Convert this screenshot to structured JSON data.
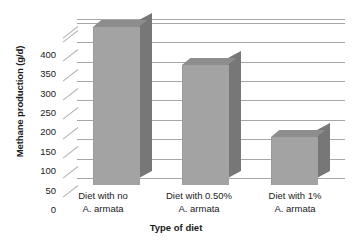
{
  "clipped_title": "Figure: Methane production by diet",
  "chart_data": {
    "type": "bar",
    "title": "",
    "subtitle": "",
    "xlabel": "Type of diet",
    "ylabel": "Methane production (g/d)",
    "categories": [
      "Diet with no\nA. armata",
      "Diet with 0.50%\nA. armata",
      "Diet with 1%\nA. armata"
    ],
    "category_lines": [
      [
        "Diet with no",
        "A. armata"
      ],
      [
        "Diet with 0.50%",
        "A. armata"
      ],
      [
        "Diet with 1%",
        "A. armata"
      ]
    ],
    "values": [
      408,
      308,
      123
    ],
    "ylim": [
      0,
      400
    ],
    "yticks": [
      400,
      350,
      300,
      250,
      200,
      150,
      100,
      50,
      0
    ],
    "ytick_labels": [
      "400",
      "350",
      "300",
      "250",
      "200",
      "150",
      "100",
      "50",
      "0"
    ],
    "grid": true,
    "grid_orientation": "horizontal",
    "legend": "none",
    "style": "3d-column",
    "colors": {
      "bar_front": "#a3a3a3",
      "bar_side": "#777777",
      "bar_top": "#8d8d8d",
      "gridline": "#a7a7a7",
      "text": "#1a1a1a",
      "background": "#ffffff"
    }
  }
}
